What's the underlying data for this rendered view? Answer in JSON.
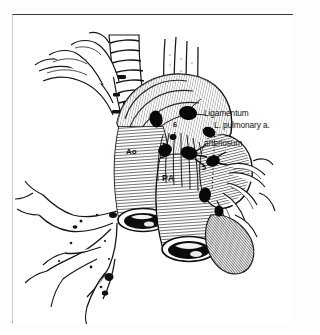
{
  "figure": {
    "kind": "anatomical-line-drawing",
    "style": "black-and-white engraved line art on scanned page",
    "ink_color": "#111111",
    "page_color": "#ffffff",
    "frame_color": "#2e2e2e"
  },
  "labels": {
    "ligamentum_arteriosum_line1": "Ligamentum",
    "ligamentum_arteriosum_line2": "arteriosum",
    "left_pulmonary_artery": "L. pulmonary a.",
    "aorta": "Ao",
    "pulmonary_artery": "PA",
    "node_station_5": "5",
    "node_station_6": "6"
  },
  "structures": [
    {
      "name": "trachea",
      "description": "vertical airway with stacked cartilage rings, upper center-left"
    },
    {
      "name": "esophagus-strands",
      "description": "vertical parallel strands descending at upper center"
    },
    {
      "name": "aortic-arch",
      "description": "large curved vessel, cut end at lower left of vessel pair"
    },
    {
      "name": "pulmonary-trunk",
      "description": "large curved vessel, cut end at lower center"
    },
    {
      "name": "left-pulmonary-artery",
      "description": "branch passing to the right of the pulmonary trunk"
    },
    {
      "name": "bronchial-tree",
      "description": "branching airway and vessels extending to lower left"
    },
    {
      "name": "lymph-nodes",
      "description": "solid black ovoid nodules clustered around the aortopulmonary window"
    }
  ]
}
